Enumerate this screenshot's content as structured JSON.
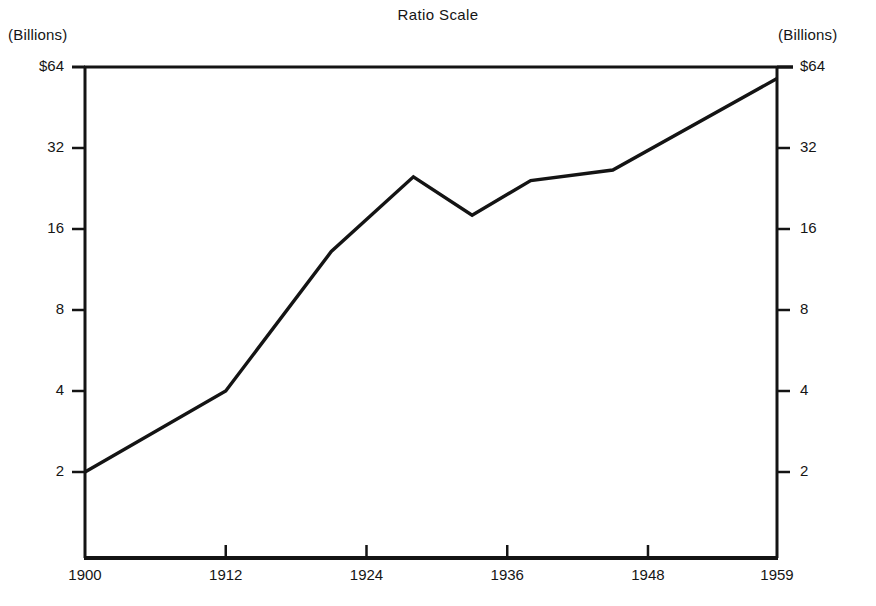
{
  "chart_data": {
    "type": "line",
    "title": "Ratio Scale",
    "xlabel": "",
    "ylabel": "",
    "unit_label_left": "(Billions)",
    "unit_label_right": "(Billions)",
    "scale": "log2",
    "grid": false,
    "legend": "none",
    "ylim": [
      1.45,
      64
    ],
    "xlim": [
      1900,
      1959
    ],
    "y_ticks": [
      {
        "value": 64,
        "label_left": "$64",
        "label_right": "$64"
      },
      {
        "value": 32,
        "label_left": "32",
        "label_right": "32"
      },
      {
        "value": 16,
        "label_left": "16",
        "label_right": "16"
      },
      {
        "value": 8,
        "label_left": "8",
        "label_right": "8"
      },
      {
        "value": 4,
        "label_left": "4",
        "label_right": "4"
      },
      {
        "value": 2,
        "label_left": "2",
        "label_right": "2"
      }
    ],
    "x_ticks": [
      {
        "value": 1900,
        "label": "1900"
      },
      {
        "value": 1912,
        "label": "1912"
      },
      {
        "value": 1924,
        "label": "1924"
      },
      {
        "value": 1936,
        "label": "1936"
      },
      {
        "value": 1948,
        "label": "1948"
      },
      {
        "value": 1959,
        "label": "1959"
      }
    ],
    "x": [
      1900,
      1912,
      1921,
      1928,
      1933,
      1938,
      1945,
      1959
    ],
    "values": [
      2.0,
      4.0,
      13.2,
      25.0,
      18.0,
      24.2,
      26.5,
      58.0
    ],
    "series": [
      {
        "name": "series-1",
        "color": "#141414",
        "values": [
          2.0,
          4.0,
          13.2,
          25.0,
          18.0,
          24.2,
          26.5,
          58.0
        ]
      }
    ]
  },
  "axes": {
    "line_color": "#141414",
    "plot_left_px": 85,
    "plot_right_px": 777,
    "plot_top_px": 67,
    "plot_bottom_px": 558
  }
}
